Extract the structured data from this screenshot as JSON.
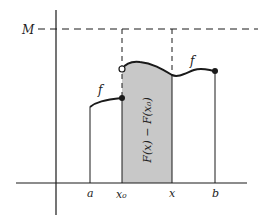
{
  "diagram": {
    "labels": {
      "upper_bound": "M",
      "function_left": "f",
      "function_right": "f",
      "region": "F(x) − F(x₀)",
      "tick_a": "a",
      "tick_x0": "x₀",
      "tick_x": "x",
      "tick_b": "b"
    },
    "colors": {
      "line": "#1a1a1a",
      "shade": "#c8c8c8",
      "background": "#ffffff"
    }
  }
}
